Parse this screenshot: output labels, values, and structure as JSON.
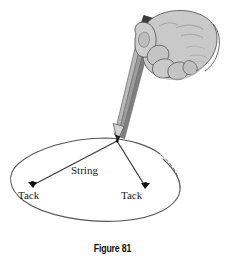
{
  "figure": {
    "caption": "Figure 81",
    "kind": "geometry-diagram",
    "background_color": "#ffffff"
  },
  "labels": {
    "string": "String",
    "tack_left": "Tack",
    "tack_right": "Tack"
  },
  "colors": {
    "outline": "#4a4a4a",
    "ink": "#1a1a1a",
    "hand_fill": "#c9c9c9",
    "hand_shadow": "#b0b0b0",
    "hand_outline": "#5a5a5a",
    "pencil_body": "#9a9a9a",
    "pencil_light": "#bdbdbd",
    "pencil_dark": "#6e6e6e",
    "pencil_tip_dark": "#2b2b2b",
    "pencil_top_dark": "#3a3a3a",
    "ellipse_stroke": "#555555",
    "tack_dot": "#111111"
  },
  "geometry": {
    "ellipse": {
      "cx": 95,
      "cy": 180,
      "rx": 85,
      "ry": 42,
      "solid_arc_note": "left and lower portion drawn solid",
      "dashed_arc_note": "upper-right arc drawn dashed"
    },
    "pencil_tip_point": {
      "x": 117,
      "y": 141
    },
    "tack_left_point": {
      "x": 32,
      "y": 185
    },
    "tack_right_point": {
      "x": 145,
      "y": 186
    },
    "string_segments": [
      {
        "from": "pencil_tip_point",
        "to": "tack_left_point"
      },
      {
        "from": "pencil_tip_point",
        "to": "tack_right_point"
      }
    ]
  },
  "icons": {
    "pencil": "pencil-icon",
    "hand": "hand-icon",
    "tack": "tack-icon"
  }
}
